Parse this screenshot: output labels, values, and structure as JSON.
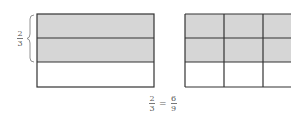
{
  "diagram": {
    "left_label": {
      "numerator": "2",
      "denominator": "3"
    },
    "left_model": {
      "rows": 3,
      "columns": 1,
      "shaded_rows": 2,
      "description": "Rectangle divided into 3 horizontal strips, top 2 shaded"
    },
    "right_model": {
      "rows": 3,
      "columns": 3,
      "shaded_rows": 2,
      "description": "Rectangle divided into 3x3 grid, top 2 rows (6 of 9 cells) shaded"
    },
    "equation": {
      "left": {
        "numerator": "2",
        "denominator": "3"
      },
      "operator": "=",
      "right": {
        "numerator": "6",
        "denominator": "9"
      }
    },
    "colors": {
      "shade": "#d6d6d6",
      "line": "#333333",
      "text": "#555555"
    }
  }
}
